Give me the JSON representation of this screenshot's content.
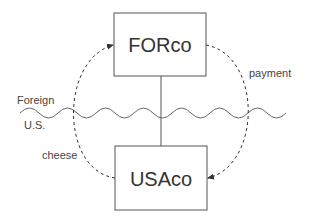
{
  "diagram": {
    "nodes": [
      {
        "id": "forco",
        "label": "FORco"
      },
      {
        "id": "usaco",
        "label": "USAco"
      }
    ],
    "boundary": {
      "above_label": "Foreign",
      "below_label": "U.S."
    },
    "flows": [
      {
        "from": "usaco",
        "to": "forco",
        "label": "cheese",
        "style": "dashed"
      },
      {
        "from": "forco",
        "to": "usaco",
        "label": "payment",
        "style": "dashed"
      }
    ],
    "ownership_link": {
      "from": "forco",
      "to": "usaco",
      "style": "solid"
    }
  },
  "colors": {
    "line": "#555555",
    "text": "#333333",
    "background": "#ffffff"
  }
}
